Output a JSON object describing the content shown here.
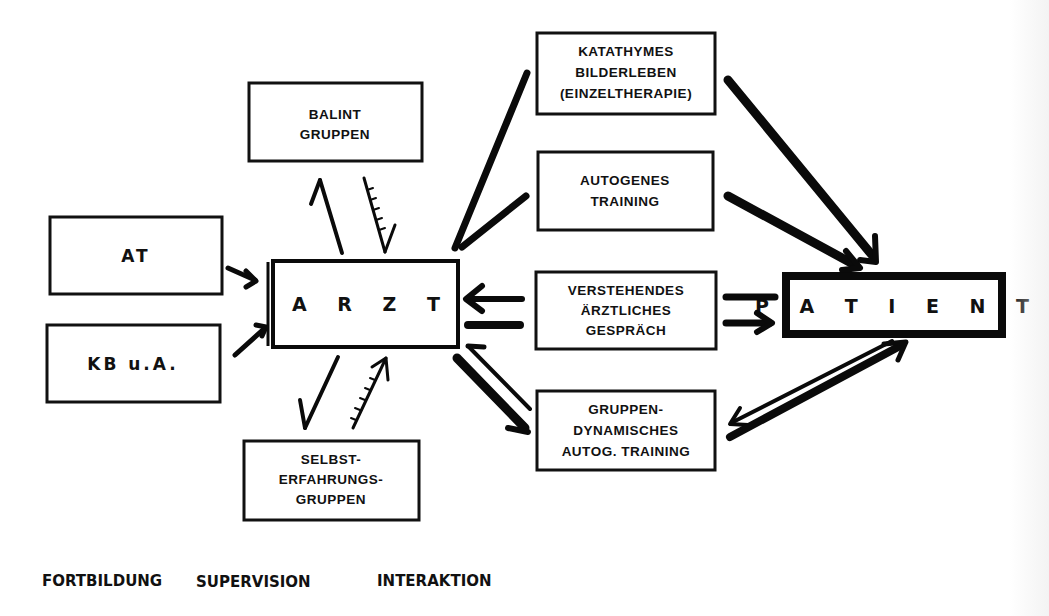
{
  "diagram": {
    "center_node": {
      "id": "arzt",
      "label": "A R Z T"
    },
    "target_node": {
      "id": "patient",
      "label": "P A T I E N T"
    },
    "fortbildung_nodes": [
      {
        "id": "at",
        "label": "AT"
      },
      {
        "id": "kb",
        "label": "KB u.A."
      }
    ],
    "supervision_nodes": [
      {
        "id": "balint",
        "lines": [
          "BALINT",
          "GRUPPEN"
        ]
      },
      {
        "id": "selbst",
        "lines": [
          "SELBST-",
          "ERFAHRUNGS-",
          "GRUPPEN"
        ]
      }
    ],
    "interaktion_nodes": [
      {
        "id": "katathymes",
        "lines": [
          "KATATHYMES",
          "BILDERLEBEN",
          "(EINZELTHERAPIE)"
        ]
      },
      {
        "id": "autogenes",
        "lines": [
          "AUTOGENES",
          "TRAINING"
        ]
      },
      {
        "id": "verstehendes",
        "lines": [
          "VERSTEHENDES",
          "ÄRZTLICHES",
          "GESPRÄCH"
        ]
      },
      {
        "id": "gruppen",
        "lines": [
          "GRUPPEN-",
          "DYNAMISCHES",
          "AUTOG. TRAINING"
        ]
      }
    ],
    "edges": [
      {
        "from": "at",
        "to": "arzt"
      },
      {
        "from": "kb",
        "to": "arzt"
      },
      {
        "from": "arzt",
        "to": "balint"
      },
      {
        "from": "balint",
        "to": "arzt"
      },
      {
        "from": "arzt",
        "to": "selbst"
      },
      {
        "from": "selbst",
        "to": "arzt"
      },
      {
        "from": "arzt",
        "to": "katathymes"
      },
      {
        "from": "arzt",
        "to": "autogenes"
      },
      {
        "from": "verstehendes",
        "to": "arzt"
      },
      {
        "from": "arzt",
        "to": "verstehendes"
      },
      {
        "from": "gruppen",
        "to": "arzt"
      },
      {
        "from": "arzt",
        "to": "gruppen"
      },
      {
        "from": "katathymes",
        "to": "patient"
      },
      {
        "from": "autogenes",
        "to": "patient"
      },
      {
        "from": "patient",
        "to": "verstehendes"
      },
      {
        "from": "verstehendes",
        "to": "patient"
      },
      {
        "from": "patient",
        "to": "gruppen"
      },
      {
        "from": "gruppen",
        "to": "patient"
      }
    ],
    "column_labels": {
      "fortbildung": "FORTBILDUNG",
      "supervision": "SUPERVISION",
      "interaktion": "INTERAKTION"
    }
  }
}
